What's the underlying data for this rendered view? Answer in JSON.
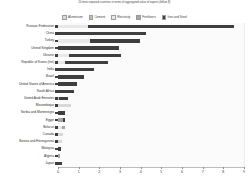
{
  "chart_data": {
    "type": "bar",
    "orientation": "horizontal",
    "stacked": true,
    "title": "20 most exposed countries in terms of aggregated value of exports (billion $)",
    "xlabel": "",
    "ylabel": "",
    "xlim": [
      0,
      9
    ],
    "xticks": [
      "0",
      "1",
      "2",
      "3",
      "4",
      "5",
      "6",
      "7",
      "8",
      "9"
    ],
    "grid": true,
    "legend_position": "top",
    "categories": [
      "Russian Federation",
      "China",
      "Turkey",
      "United Kingdom",
      "Ukraine",
      "Republic of Korea (the)",
      "India",
      "Brazil",
      "United States of America",
      "South Africa",
      "United Arab Emirates",
      "Mozambique",
      "Serbia and Montenegro",
      "Egypt",
      "Belarus",
      "Canada",
      "Bosnia and Herzegovina",
      "Malaysia",
      "Algeria",
      "Japan"
    ],
    "series": [
      {
        "name": "Aluminium",
        "color": "#d9d9d9",
        "values": [
          0.0,
          0.0,
          0.0,
          0.0,
          0.0,
          0.0,
          0.0,
          0.0,
          0.0,
          0.0,
          0.0,
          0.62,
          0.0,
          0.0,
          0.0,
          0.24,
          0.18,
          0.0,
          0.0,
          0.0
        ]
      },
      {
        "name": "Cement",
        "color": "#bfbfbf",
        "values": [
          0.0,
          0.0,
          0.0,
          0.0,
          0.0,
          0.0,
          0.0,
          0.0,
          0.0,
          0.0,
          0.06,
          0.0,
          0.0,
          0.0,
          0.0,
          0.0,
          0.0,
          0.0,
          0.0,
          0.0
        ]
      },
      {
        "name": "Electricity",
        "color": "#e8e8e8",
        "values": [
          1.45,
          0.0,
          1.55,
          0.0,
          0.55,
          0.35,
          0.0,
          0.0,
          0.0,
          0.0,
          0.0,
          0.0,
          0.0,
          0.0,
          0.18,
          0.0,
          0.0,
          0.0,
          0.0,
          0.0
        ]
      },
      {
        "name": "Fertilizers",
        "color": "#a6a6a6",
        "values": [
          0.0,
          0.0,
          0.0,
          0.0,
          0.0,
          0.0,
          0.0,
          0.0,
          0.0,
          0.0,
          0.0,
          0.0,
          0.0,
          0.22,
          0.14,
          0.0,
          0.0,
          0.0,
          0.1,
          0.0
        ]
      },
      {
        "name": "Iron and Steel",
        "color": "#3f3f3f",
        "values": [
          7.05,
          4.25,
          2.4,
          2.95,
          2.5,
          2.05,
          1.72,
          1.25,
          0.9,
          0.78,
          0.44,
          0.0,
          0.33,
          0.1,
          0.0,
          0.0,
          0.0,
          0.14,
          0.0,
          0.21
        ]
      }
    ]
  }
}
